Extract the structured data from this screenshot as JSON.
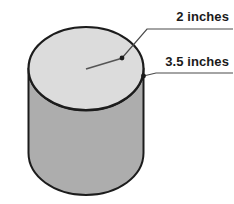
{
  "figure": {
    "type": "geometry-diagram",
    "shape": "cylinder",
    "title": "",
    "background_color": "#ffffff",
    "colors": {
      "top_face_fill": "#dcdcdc",
      "body_fill": "#adadad",
      "outline": "#1c1c1c",
      "leader_line": "#3a3a3a",
      "label_text": "#1a1a1a"
    },
    "labels": [
      {
        "id": "top-diameter",
        "text": "2 inches",
        "measures": "radius-of-top-circle",
        "anchor_point": [
          122,
          58
        ]
      },
      {
        "id": "height",
        "text": "3.5 inches",
        "measures": "height-of-cylinder",
        "anchor_point": [
          143,
          76
        ]
      }
    ],
    "geometry": {
      "cylinder_left_x": 28,
      "cylinder_right_x": 143,
      "top_ellipse_top_y": 27,
      "top_ellipse_bottom_y": 110,
      "bottom_y": 195,
      "radius_line_y": 69
    }
  }
}
